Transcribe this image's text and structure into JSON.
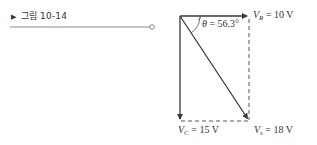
{
  "figure": {
    "marker": "▶",
    "label": "그림 10-14"
  },
  "diagram": {
    "type": "phasor-diagram",
    "vectors": {
      "VR": {
        "symbol": "V",
        "subscript": "R",
        "value": "= 10 V"
      },
      "VC": {
        "symbol": "V",
        "subscript": "C",
        "value": "= 15 V"
      },
      "Vs": {
        "symbol": "V",
        "subscript": "s",
        "value": "= 18 V"
      }
    },
    "angle": {
      "symbol": "θ",
      "value": "= 56.3°"
    },
    "colors": {
      "line": "#3a3a3a",
      "dashed": "#555555",
      "rule": "#777777"
    }
  }
}
